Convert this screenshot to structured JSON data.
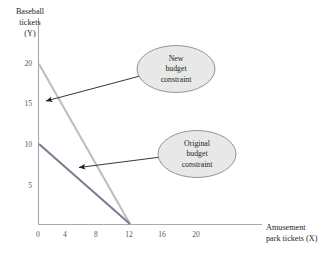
{
  "chart_data": {
    "type": "line",
    "title": "",
    "subtitle": "",
    "xlabel": "Amusement park tickets (X)",
    "ylabel": "Baseball tickets (Y)",
    "xlim": [
      0,
      22.5
    ],
    "ylim": [
      0,
      22
    ],
    "grid": false,
    "legend_position": "none",
    "xticks": [
      "0",
      "4",
      "8",
      "12",
      "16",
      "20"
    ],
    "xtick_values": [
      0,
      4,
      8,
      12,
      16,
      20
    ],
    "yticks": [
      "5",
      "10",
      "15",
      "20"
    ],
    "ytick_values": [
      5,
      10,
      15,
      20
    ],
    "series": [
      {
        "name": "Original budget constraint",
        "color": "#7e7b93",
        "x": [
          0,
          12
        ],
        "values": [
          10,
          0
        ],
        "x_intercept": 12,
        "y_intercept": 10,
        "slope": -0.8333
      },
      {
        "name": "New budget constraint",
        "color": "#bcbec0",
        "x": [
          0,
          12
        ],
        "values": [
          20,
          0
        ],
        "x_intercept": 12,
        "y_intercept": 20,
        "slope": -1.6667
      }
    ],
    "annotations": [
      {
        "id": "new-budget-constraint",
        "text": "New\nbudget\nconstraint",
        "shape": "ellipse",
        "fill": "#e8e8e8",
        "stroke": "#808285",
        "points_to": "new-budget-constraint-line"
      },
      {
        "id": "original-budget-constraint",
        "text": "Original\nbudget\nconstraint",
        "shape": "ellipse",
        "fill": "#e8e8e8",
        "stroke": "#808285",
        "points_to": "original-budget-constraint-line"
      }
    ]
  },
  "axes": {
    "y_title": "Baseball\ntickets\n(Y)",
    "x_title": "Amusement\npark tickets (X)",
    "axis_color": "#a7a9ac",
    "tick_text_color": "#58595b"
  },
  "callouts": {
    "new": "New\nbudget\nconstraint",
    "original": "Original\nbudget\nconstraint"
  },
  "colors": {
    "background": "#ffffff",
    "new_line": "#bcbec0",
    "original_line": "#7e7b93",
    "callout_fill": "#e8e8e8",
    "callout_stroke": "#808285",
    "arrow": "#231f20",
    "text": "#231f20"
  }
}
